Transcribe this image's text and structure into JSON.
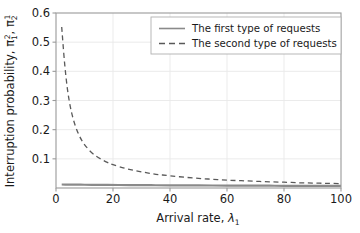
{
  "chart_data": {
    "type": "line",
    "title": "",
    "xlabel": "Arrival rate, λ₁",
    "xlabel_main": "Arrival rate, ",
    "xlabel_symbol": "λ",
    "xlabel_symbol_sub": "1",
    "ylabel": "Interruption probability, π₁², π₂¹",
    "ylabel_main": "Interruption probability, ",
    "ylabel_symbol_1": "π",
    "ylabel_symbol_1_sub": "1",
    "ylabel_symbol_1_sup": "2",
    "ylabel_separator": ", ",
    "ylabel_symbol_2": "π",
    "ylabel_symbol_2_sub": "2",
    "ylabel_symbol_2_sup": "1",
    "xlim": [
      0,
      100
    ],
    "ylim": [
      0,
      0.6
    ],
    "xticks": [
      0,
      20,
      40,
      60,
      80,
      100
    ],
    "xtick_labels": [
      "0",
      "20",
      "40",
      "60",
      "80",
      "100"
    ],
    "yticks": [
      0.1,
      0.2,
      0.3,
      0.4,
      0.5,
      0.6
    ],
    "ytick_labels": [
      "0.1",
      "0.2",
      "0.3",
      "0.4",
      "0.5",
      "0.6"
    ],
    "grid": true,
    "grid_color": "#e9e9e9",
    "legend_position": "upper right",
    "series": [
      {
        "name": "The first type of requests",
        "style": "solid",
        "color": "#8a8a8a",
        "linewidth": 2.2,
        "x": [
          2,
          4,
          6,
          8,
          10,
          14,
          18,
          22,
          26,
          30,
          35,
          40,
          45,
          50,
          55,
          60,
          65,
          70,
          75,
          80,
          85,
          90,
          95,
          100
        ],
        "values": [
          0.012,
          0.0118,
          0.0116,
          0.0114,
          0.0112,
          0.0109,
          0.0106,
          0.0103,
          0.01,
          0.0098,
          0.0095,
          0.0092,
          0.009,
          0.0088,
          0.0086,
          0.0084,
          0.0082,
          0.008,
          0.0078,
          0.0076,
          0.0075,
          0.0073,
          0.0072,
          0.007
        ]
      },
      {
        "name": "The second type of requests",
        "style": "dashed",
        "color": "#595959",
        "linewidth": 1.3,
        "x": [
          2,
          3,
          4,
          5,
          6,
          7,
          8,
          9,
          10,
          12,
          14,
          16,
          18,
          20,
          24,
          28,
          32,
          36,
          40,
          45,
          50,
          55,
          60,
          65,
          70,
          75,
          80,
          85,
          90,
          95,
          100
        ],
        "values": [
          0.552,
          0.43,
          0.34,
          0.28,
          0.238,
          0.207,
          0.183,
          0.164,
          0.149,
          0.126,
          0.11,
          0.098,
          0.088,
          0.08,
          0.068,
          0.059,
          0.052,
          0.046,
          0.042,
          0.037,
          0.033,
          0.03,
          0.027,
          0.025,
          0.023,
          0.021,
          0.02,
          0.018,
          0.017,
          0.016,
          0.015
        ]
      }
    ]
  },
  "legend": {
    "entries": [
      {
        "label": "The first type of requests",
        "style": "solid"
      },
      {
        "label": "The second type of requests",
        "style": "dashed"
      }
    ]
  },
  "colors": {
    "axis": "#9a9a9a",
    "grid": "#e9e9e9",
    "text": "#1a1a1a",
    "series_solid": "#8a8a8a",
    "series_dashed": "#595959",
    "background": "#ffffff",
    "legend_border": "#b0b0b0"
  }
}
